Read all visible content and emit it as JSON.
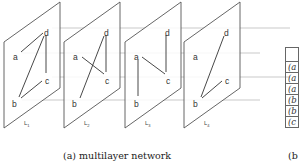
{
  "figure": {
    "layers": [
      {
        "label": "L",
        "subscript": "1",
        "edges": [
          [
            "a",
            "d"
          ],
          [
            "d",
            "c"
          ],
          [
            "d",
            "b"
          ],
          [
            "b",
            "c"
          ]
        ]
      },
      {
        "label": "L",
        "subscript": "2",
        "edges": [
          [
            "a",
            "c"
          ],
          [
            "b",
            "d"
          ],
          [
            "d",
            "c"
          ]
        ]
      },
      {
        "label": "L",
        "subscript": "3",
        "edges": [
          [
            "a",
            "b"
          ],
          [
            "a",
            "c"
          ],
          [
            "d",
            "c"
          ]
        ]
      },
      {
        "label": "L",
        "subscript": "4",
        "edges": [
          [
            "b",
            "d"
          ],
          [
            "b",
            "c"
          ]
        ]
      }
    ],
    "nodes": {
      "a": "a",
      "b": "b",
      "c": "c",
      "d": "d"
    },
    "colors": {
      "plane": "#555555",
      "edge": "#333333",
      "interlayer": "#bbbbbb"
    }
  },
  "captions": {
    "a": "(a) multilayer network",
    "b": "(b"
  },
  "table": {
    "header": "",
    "rows": [
      "(a",
      "(a",
      "(a",
      "(b",
      "(b",
      "(c"
    ]
  }
}
